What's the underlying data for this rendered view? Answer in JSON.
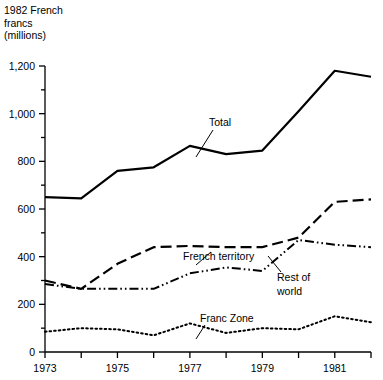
{
  "axis_title": "1982 French\nfrancs\n(millions)",
  "chart_data": {
    "type": "line",
    "title": "",
    "xlabel": "",
    "ylabel": "1982 French francs (millions)",
    "xlim": [
      1973,
      1982
    ],
    "ylim": [
      0,
      1200
    ],
    "grid": false,
    "legend_position": "inline-annotations",
    "x": [
      1973,
      1974,
      1975,
      1976,
      1977,
      1978,
      1979,
      1980,
      1981,
      1982
    ],
    "y_ticks": [
      0,
      200,
      400,
      600,
      800,
      1000,
      1200
    ],
    "y_tick_labels": [
      "0",
      "200",
      "400",
      "600",
      "800",
      "1,000",
      "1,200"
    ],
    "y_minor_ticks": [
      100,
      300,
      500,
      700,
      900,
      1100
    ],
    "x_ticks": [
      1973,
      1974,
      1975,
      1976,
      1977,
      1978,
      1979,
      1980,
      1981,
      1982
    ],
    "x_tick_labels": [
      "1973",
      "",
      "1975",
      "",
      "1977",
      "",
      "1979",
      "",
      "1981",
      ""
    ],
    "series": [
      {
        "name": "Total",
        "style": "solid",
        "label": "Total",
        "values": [
          650,
          645,
          760,
          775,
          865,
          830,
          845,
          1010,
          1180,
          1155
        ]
      },
      {
        "name": "French territory",
        "style": "dashed",
        "label": "French territory",
        "values": [
          300,
          265,
          370,
          440,
          445,
          440,
          440,
          480,
          630,
          640
        ]
      },
      {
        "name": "Rest of world",
        "style": "dash-dot-dot",
        "label": "Rest of world",
        "values": [
          285,
          265,
          265,
          265,
          330,
          355,
          340,
          470,
          450,
          440
        ]
      },
      {
        "name": "Franc Zone",
        "style": "dotted",
        "label": "Franc Zone",
        "values": [
          85,
          100,
          95,
          70,
          120,
          80,
          100,
          95,
          150,
          125
        ]
      }
    ]
  },
  "annotations": [
    {
      "name": "total-label",
      "text": "Total"
    },
    {
      "name": "french-territory-label",
      "text": "French territory"
    },
    {
      "name": "rest-of-world-label",
      "text": "Rest of"
    },
    {
      "name": "rest-of-world-label-2",
      "text": "world"
    },
    {
      "name": "franc-zone-label",
      "text": "Franc Zone"
    }
  ]
}
